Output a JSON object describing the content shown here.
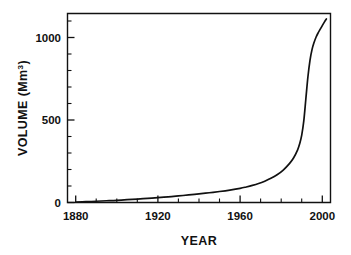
{
  "chart_data": {
    "type": "line",
    "title": "",
    "xlabel": "YEAR",
    "ylabel": "VOLUME (Mm³)",
    "ylabel_base": "VOLUME (Mm",
    "ylabel_sup": "3",
    "ylabel_close": ")",
    "xlim": [
      1876,
      2004
    ],
    "ylim": [
      0,
      1205
    ],
    "grid": false,
    "legend": null,
    "x_tick_labels": [
      "1880",
      "1920",
      "1960",
      "2000"
    ],
    "x_ticks": [
      1880,
      1920,
      1960,
      2000
    ],
    "x_minor_interval": 10,
    "y_tick_labels": [
      "0",
      "500",
      "1000"
    ],
    "y_ticks": [
      0,
      500,
      1000
    ],
    "y_minor_interval": 100,
    "series": [
      {
        "name": "Cumulative volume",
        "x": [
          1880,
          1885,
          1890,
          1895,
          1900,
          1905,
          1910,
          1915,
          1920,
          1925,
          1930,
          1935,
          1940,
          1945,
          1950,
          1955,
          1960,
          1963,
          1966,
          1969,
          1972,
          1975,
          1978,
          1981,
          1984,
          1986,
          1988,
          1989,
          1990,
          1991,
          1992,
          1993,
          1994,
          1995,
          1996,
          1997,
          1998,
          1999,
          2000,
          2001,
          2002
        ],
        "values": [
          2,
          5,
          8,
          11,
          14,
          18,
          22,
          26,
          31,
          36,
          42,
          48,
          55,
          62,
          70,
          79,
          90,
          99,
          109,
          121,
          136,
          154,
          177,
          207,
          248,
          284,
          336,
          375,
          430,
          520,
          660,
          800,
          905,
          975,
          1020,
          1055,
          1082,
          1105,
          1128,
          1150,
          1170
        ]
      }
    ]
  },
  "axes": {
    "x_title": "YEAR",
    "y_title": "VOLUME (Mm3)"
  }
}
